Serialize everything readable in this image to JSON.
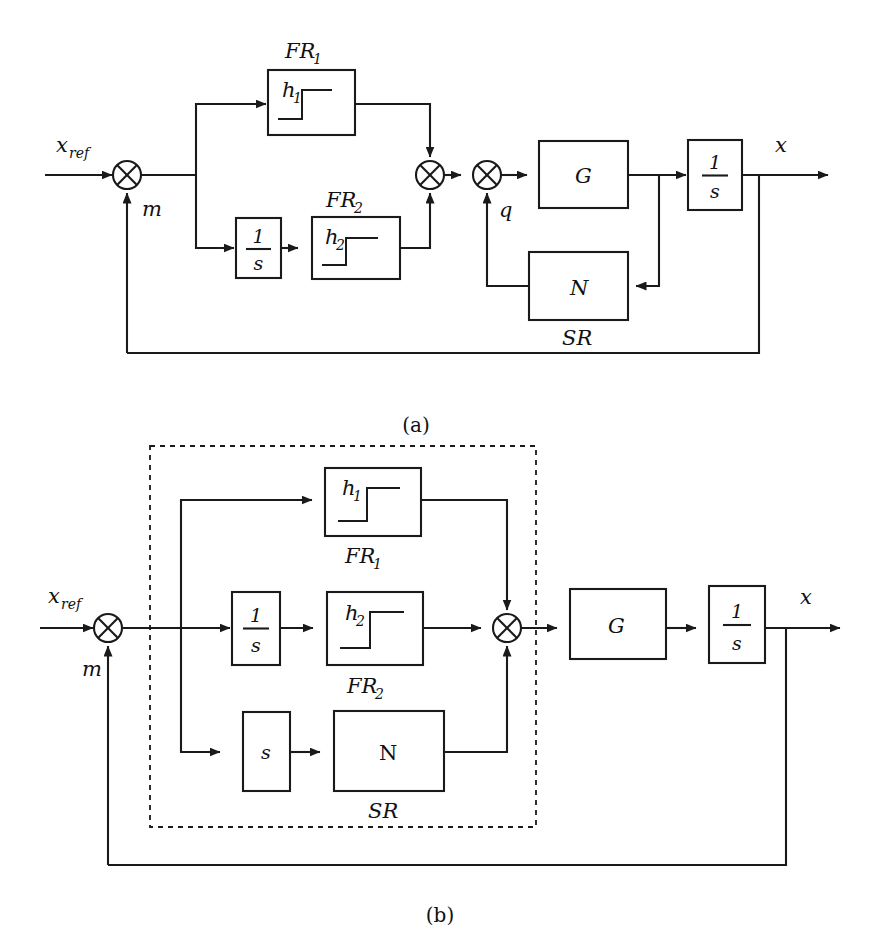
{
  "figure": {
    "type": "control-block-diagram",
    "background_color": "#ffffff",
    "line_color": "#1a1a1a",
    "captions": [
      {
        "id": "a",
        "text": "(a)"
      },
      {
        "id": "b",
        "text": "(b)"
      }
    ]
  },
  "diagram_a": {
    "caption": "(a)",
    "signals": {
      "input": "x",
      "input_sub": "ref",
      "feedback": "m",
      "inner_feedback": "q",
      "output": "x"
    },
    "blocks": [
      {
        "id": "fr1",
        "label": "h",
        "sub": "1",
        "caption": "FR1",
        "caption_text": "FR",
        "caption_sub": "1",
        "kind": "hysteresis",
        "caption_position": "above"
      },
      {
        "id": "int1",
        "label_num": "1",
        "label_den": "s",
        "kind": "fraction"
      },
      {
        "id": "fr2",
        "label": "h",
        "sub": "2",
        "caption_text": "FR",
        "caption_sub": "2",
        "kind": "hysteresis",
        "caption_position": "above"
      },
      {
        "id": "g",
        "label": "G",
        "kind": "plain"
      },
      {
        "id": "int2",
        "label_num": "1",
        "label_den": "s",
        "kind": "fraction"
      },
      {
        "id": "n",
        "label": "N",
        "caption_text": "SR",
        "kind": "plain",
        "caption_position": "below"
      }
    ],
    "sum_junctions": [
      {
        "id": "sum-main"
      },
      {
        "id": "sum-fr"
      },
      {
        "id": "sum-q"
      }
    ]
  },
  "diagram_b": {
    "caption": "(b)",
    "signals": {
      "input": "x",
      "input_sub": "ref",
      "feedback": "m",
      "output": "x"
    },
    "grouping_box": {
      "id": "dashed-group",
      "style": "dashed"
    },
    "blocks": [
      {
        "id": "fr1",
        "label": "h",
        "sub": "1",
        "caption_text": "FR",
        "caption_sub": "1",
        "kind": "hysteresis",
        "caption_position": "below"
      },
      {
        "id": "int1",
        "label_num": "1",
        "label_den": "s",
        "kind": "fraction"
      },
      {
        "id": "fr2",
        "label": "h",
        "sub": "2",
        "caption_text": "FR",
        "caption_sub": "2",
        "kind": "hysteresis",
        "caption_position": "below"
      },
      {
        "id": "sblk",
        "label": "s",
        "kind": "plain"
      },
      {
        "id": "n",
        "label": "N",
        "caption_text": "SR",
        "kind": "plain",
        "caption_position": "below"
      },
      {
        "id": "g",
        "label": "G",
        "kind": "plain"
      },
      {
        "id": "int2",
        "label_num": "1",
        "label_den": "s",
        "kind": "fraction"
      }
    ],
    "sum_junctions": [
      {
        "id": "sum-main"
      },
      {
        "id": "sum-merge"
      }
    ]
  },
  "labels": {
    "x": "x",
    "ref": "ref",
    "m": "m",
    "q": "q",
    "G": "G",
    "N_a": "N",
    "N_b": "N",
    "SR": "SR",
    "FR": "FR",
    "one": "1",
    "s": "s",
    "h": "h",
    "sub1": "1",
    "sub2": "2",
    "caption_a": "(a)",
    "caption_b": "(b)"
  }
}
